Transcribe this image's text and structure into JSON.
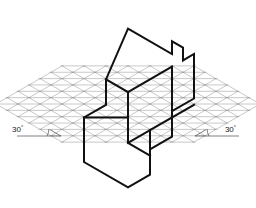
{
  "figure": {
    "type": "isometric-drawing",
    "canvas": {
      "width": 256,
      "height": 208,
      "background": "#ffffff"
    },
    "grid": {
      "name": "isometric-triangular-grid",
      "color": "#9a9a9a",
      "line_width": 0.55,
      "center": {
        "x": 128,
        "y": 104
      },
      "unit_x": 11.0,
      "unit_y": 6.35,
      "radius_cells": 6,
      "directions": [
        "vertical",
        "30-up-right",
        "30-up-left"
      ]
    },
    "solid": {
      "name": "stepped-block",
      "color": "#111111",
      "line_width": 2.0,
      "outline_points": [
        [
          128.0,
          28.6
        ],
        [
          172.0,
          54.0
        ],
        [
          172.0,
          41.3
        ],
        [
          183.0,
          47.6
        ],
        [
          183.0,
          60.4
        ],
        [
          194.0,
          54.0
        ],
        [
          194.0,
          98.5
        ],
        [
          172.0,
          111.2
        ],
        [
          172.0,
          136.6
        ],
        [
          150.0,
          149.3
        ],
        [
          150.0,
          174.7
        ],
        [
          128.0,
          187.4
        ],
        [
          84.0,
          162.0
        ],
        [
          84.0,
          117.5
        ],
        [
          106.0,
          104.8
        ],
        [
          106.0,
          79.4
        ]
      ],
      "interior_edges": [
        [
          [
            106.0,
            79.4
          ],
          [
            128.0,
            92.1
          ],
          [
            128.0,
            117.5
          ],
          [
            84.0,
            117.5
          ]
        ],
        [
          [
            128.0,
            92.1
          ],
          [
            172.0,
            66.7
          ]
        ],
        [
          [
            128.0,
            117.5
          ],
          [
            128.0,
            142.9
          ],
          [
            150.0,
            155.6
          ]
        ],
        [
          [
            128.0,
            142.9
          ],
          [
            150.0,
            130.2
          ],
          [
            150.0,
            149.3
          ]
        ],
        [
          [
            172.0,
            66.7
          ],
          [
            172.0,
            111.2
          ]
        ],
        [
          [
            150.0,
            130.2
          ],
          [
            194.0,
            104.8
          ]
        ]
      ]
    },
    "annotations": [
      {
        "name": "angle-label-left",
        "text": "30",
        "degree_symbol": "°",
        "value": 30,
        "unit": "degrees",
        "position": "lower-left",
        "text_x": 12,
        "text_y": 132,
        "leader": [
          [
            17.0,
            136.0
          ],
          [
            61.0,
            136.0
          ],
          [
            50.0,
            129.7
          ]
        ],
        "arc_center": [
          61.0,
          136.0
        ],
        "arc_radius": 14
      },
      {
        "name": "angle-label-right",
        "text": "30",
        "degree_symbol": "°",
        "value": 30,
        "unit": "degrees",
        "position": "lower-right",
        "text_x": 236,
        "text_y": 132,
        "leader": [
          [
            239.0,
            136.0
          ],
          [
            195.0,
            136.0
          ],
          [
            206.0,
            129.7
          ]
        ],
        "arc_center": [
          195.0,
          136.0
        ],
        "arc_radius": 14
      }
    ]
  }
}
